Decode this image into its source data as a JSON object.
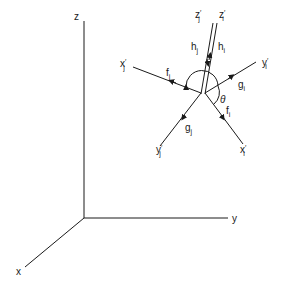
{
  "diagram": {
    "type": "coordinate-frame-diagram",
    "global_axes": {
      "x": {
        "label": "x"
      },
      "y": {
        "label": "y"
      },
      "z": {
        "label": "z"
      }
    },
    "local_axes": {
      "zj": {
        "label": "z",
        "prime": "′",
        "sub": "j"
      },
      "zi": {
        "label": "z",
        "prime": "′",
        "sub": "i"
      },
      "xj": {
        "label": "x",
        "prime": "′",
        "sub": "j"
      },
      "yi": {
        "label": "y",
        "prime": "′",
        "sub": "i"
      },
      "yj": {
        "label": "y",
        "prime": "′",
        "sub": "j"
      },
      "xi": {
        "label": "x",
        "prime": "′",
        "sub": "i"
      }
    },
    "vectors": {
      "hj": {
        "label": "h",
        "sub": "j"
      },
      "hi": {
        "label": "h",
        "sub": "i"
      },
      "fj": {
        "label": "f",
        "sub": "j"
      },
      "gi": {
        "label": "g",
        "sub": "i"
      },
      "gj": {
        "label": "g",
        "sub": "j"
      },
      "fi": {
        "label": "f",
        "sub": "i"
      }
    },
    "angle": {
      "label": "θ"
    }
  }
}
